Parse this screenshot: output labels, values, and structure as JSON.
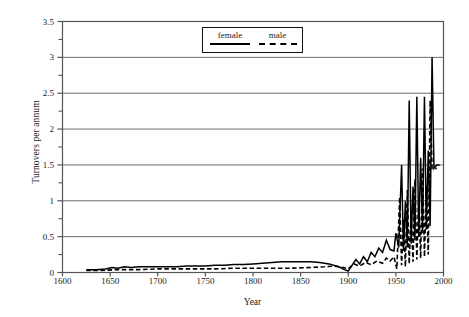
{
  "chart_data": {
    "type": "line",
    "title": "",
    "xlabel": "Year",
    "ylabel": "Turnovers per annum",
    "xlim": [
      1600,
      2000
    ],
    "ylim": [
      0,
      3.5
    ],
    "xticks": [
      1600,
      1650,
      1700,
      1750,
      1800,
      1850,
      1900,
      1950,
      2000
    ],
    "yticks": [
      0,
      0.5,
      1,
      1.5,
      2,
      2.5,
      3,
      3.5
    ],
    "yminorticks": [
      0.25,
      0.75,
      1.25,
      1.75,
      2.25,
      2.75,
      3.25
    ],
    "grid": "horizontal",
    "legend_position": "top-center",
    "series": [
      {
        "name": "female",
        "style": "solid",
        "color": "#000000",
        "points": [
          [
            1625,
            0.04
          ],
          [
            1635,
            0.04
          ],
          [
            1645,
            0.05
          ],
          [
            1652,
            0.07
          ],
          [
            1658,
            0.06
          ],
          [
            1665,
            0.08
          ],
          [
            1672,
            0.07
          ],
          [
            1680,
            0.08
          ],
          [
            1690,
            0.08
          ],
          [
            1700,
            0.08
          ],
          [
            1710,
            0.08
          ],
          [
            1720,
            0.08
          ],
          [
            1730,
            0.09
          ],
          [
            1740,
            0.09
          ],
          [
            1750,
            0.09
          ],
          [
            1760,
            0.1
          ],
          [
            1770,
            0.1
          ],
          [
            1780,
            0.11
          ],
          [
            1790,
            0.11
          ],
          [
            1800,
            0.12
          ],
          [
            1810,
            0.13
          ],
          [
            1820,
            0.14
          ],
          [
            1830,
            0.15
          ],
          [
            1840,
            0.15
          ],
          [
            1850,
            0.15
          ],
          [
            1860,
            0.15
          ],
          [
            1870,
            0.14
          ],
          [
            1880,
            0.12
          ],
          [
            1890,
            0.08
          ],
          [
            1896,
            0.04
          ],
          [
            1900,
            0.02
          ],
          [
            1904,
            0.1
          ],
          [
            1908,
            0.18
          ],
          [
            1912,
            0.12
          ],
          [
            1916,
            0.22
          ],
          [
            1920,
            0.15
          ],
          [
            1924,
            0.28
          ],
          [
            1928,
            0.22
          ],
          [
            1932,
            0.34
          ],
          [
            1936,
            0.28
          ],
          [
            1940,
            0.45
          ],
          [
            1944,
            0.32
          ],
          [
            1948,
            0.3
          ],
          [
            1950,
            0.55
          ],
          [
            1953,
            0.35
          ],
          [
            1956,
            1.5
          ],
          [
            1958,
            0.3
          ],
          [
            1960,
            1.0
          ],
          [
            1962,
            0.35
          ],
          [
            1964,
            2.4
          ],
          [
            1966,
            0.4
          ],
          [
            1968,
            1.2
          ],
          [
            1970,
            0.45
          ],
          [
            1972,
            2.45
          ],
          [
            1974,
            0.5
          ],
          [
            1976,
            1.6
          ],
          [
            1978,
            0.55
          ],
          [
            1980,
            2.45
          ],
          [
            1982,
            0.6
          ],
          [
            1984,
            1.7
          ],
          [
            1986,
            0.65
          ],
          [
            1988,
            3.0
          ],
          [
            1990,
            1.45
          ],
          [
            1993,
            1.5
          ],
          [
            1996,
            1.5
          ]
        ]
      },
      {
        "name": "male",
        "style": "dashed",
        "color": "#000000",
        "points": [
          [
            1625,
            0.03
          ],
          [
            1640,
            0.03
          ],
          [
            1660,
            0.04
          ],
          [
            1680,
            0.04
          ],
          [
            1700,
            0.05
          ],
          [
            1720,
            0.05
          ],
          [
            1740,
            0.05
          ],
          [
            1760,
            0.05
          ],
          [
            1780,
            0.06
          ],
          [
            1800,
            0.06
          ],
          [
            1820,
            0.06
          ],
          [
            1840,
            0.06
          ],
          [
            1860,
            0.07
          ],
          [
            1875,
            0.08
          ],
          [
            1885,
            0.09
          ],
          [
            1895,
            0.07
          ],
          [
            1900,
            0.05
          ],
          [
            1906,
            0.12
          ],
          [
            1912,
            0.09
          ],
          [
            1918,
            0.14
          ],
          [
            1924,
            0.11
          ],
          [
            1930,
            0.16
          ],
          [
            1936,
            0.13
          ],
          [
            1940,
            0.2
          ],
          [
            1944,
            0.16
          ],
          [
            1948,
            0.22
          ],
          [
            1951,
            0.05
          ],
          [
            1954,
            1.05
          ],
          [
            1956,
            0.1
          ],
          [
            1958,
            0.75
          ],
          [
            1960,
            0.08
          ],
          [
            1962,
            1.15
          ],
          [
            1964,
            0.12
          ],
          [
            1966,
            0.85
          ],
          [
            1968,
            0.15
          ],
          [
            1970,
            1.3
          ],
          [
            1972,
            0.18
          ],
          [
            1974,
            1.05
          ],
          [
            1976,
            0.2
          ],
          [
            1978,
            1.45
          ],
          [
            1980,
            0.22
          ],
          [
            1982,
            1.2
          ],
          [
            1984,
            0.25
          ],
          [
            1986,
            2.4
          ],
          [
            1988,
            1.45
          ],
          [
            1990,
            1.45
          ],
          [
            1993,
            1.45
          ]
        ]
      }
    ]
  },
  "axes": {
    "ylabel": "Turnovers per annum",
    "xlabel": "Year",
    "ytick_labels": [
      "0",
      "0.5",
      "1",
      "1.5",
      "2",
      "2.5",
      "3",
      "3.5"
    ],
    "xtick_labels": [
      "1600",
      "1650",
      "1700",
      "1750",
      "1800",
      "1850",
      "1900",
      "1950",
      "2000"
    ]
  },
  "legend": {
    "female_label": "female",
    "male_label": "male"
  },
  "colors": {
    "line": "#000000",
    "grid": "#6e6e6e",
    "frame": "#555555",
    "background": "#ffffff"
  }
}
